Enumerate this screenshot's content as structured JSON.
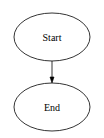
{
  "diagram": {
    "type": "flowchart",
    "nodes": [
      {
        "id": "start",
        "label": "Start",
        "shape": "ellipse"
      },
      {
        "id": "end",
        "label": "End",
        "shape": "ellipse"
      }
    ],
    "edges": [
      {
        "from": "start",
        "to": "end"
      }
    ],
    "colors": {
      "background": "#ffffff",
      "stroke": "#000000",
      "text": "#000000"
    }
  }
}
